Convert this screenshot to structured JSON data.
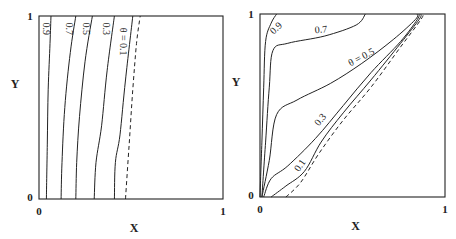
{
  "chart_data": [
    {
      "type": "line",
      "subtype": "contour",
      "panel": "left",
      "title": "",
      "xlabel": "X",
      "ylabel": "Y",
      "xlim": [
        0,
        1
      ],
      "ylim": [
        0,
        1
      ],
      "x_ticks": [
        "0",
        "1"
      ],
      "y_ticks": [
        "0",
        "1"
      ],
      "grid": false,
      "series": [
        {
          "name": "0.9",
          "label": "0.9",
          "style": "solid",
          "points": [
            [
              0.04,
              0
            ],
            [
              0.045,
              0.3
            ],
            [
              0.05,
              0.6
            ],
            [
              0.06,
              0.85
            ],
            [
              0.065,
              1
            ]
          ]
        },
        {
          "name": "0.7",
          "label": "0.7",
          "style": "solid",
          "points": [
            [
              0.12,
              0
            ],
            [
              0.125,
              0.2
            ],
            [
              0.14,
              0.5
            ],
            [
              0.17,
              0.8
            ],
            [
              0.2,
              1
            ]
          ]
        },
        {
          "name": "0.5",
          "label": "0.5",
          "style": "solid",
          "points": [
            [
              0.2,
              0
            ],
            [
              0.205,
              0.2
            ],
            [
              0.22,
              0.45
            ],
            [
              0.25,
              0.75
            ],
            [
              0.29,
              1
            ]
          ]
        },
        {
          "name": "0.3",
          "label": "0.3",
          "style": "solid",
          "points": [
            [
              0.3,
              0
            ],
            [
              0.31,
              0.2
            ],
            [
              0.34,
              0.4
            ],
            [
              0.37,
              0.7
            ],
            [
              0.41,
              1
            ]
          ]
        },
        {
          "name": "0.1",
          "label": "θ = 0.1",
          "style": "solid",
          "points": [
            [
              0.41,
              0
            ],
            [
              0.415,
              0.2
            ],
            [
              0.44,
              0.35
            ],
            [
              0.47,
              0.65
            ],
            [
              0.51,
              1
            ]
          ]
        },
        {
          "name": "boundary",
          "label": "",
          "style": "dashed",
          "points": [
            [
              0.47,
              0
            ],
            [
              0.49,
              0.3
            ],
            [
              0.51,
              0.6
            ],
            [
              0.53,
              0.85
            ],
            [
              0.55,
              1
            ]
          ]
        }
      ]
    },
    {
      "type": "line",
      "subtype": "contour",
      "panel": "right",
      "title": "",
      "xlabel": "X",
      "ylabel": "Y",
      "xlim": [
        0,
        1
      ],
      "ylim": [
        0,
        1
      ],
      "x_ticks": [
        "0",
        "1"
      ],
      "y_ticks": [
        "0",
        "1"
      ],
      "grid": false,
      "series": [
        {
          "name": "0.9",
          "label": "0.9",
          "style": "solid",
          "points": [
            [
              0.0,
              0
            ],
            [
              0.01,
              0.3
            ],
            [
              0.02,
              0.6
            ],
            [
              0.03,
              0.85
            ],
            [
              0.06,
              0.95
            ],
            [
              0.09,
              1
            ]
          ]
        },
        {
          "name": "0.7",
          "label": "0.7",
          "style": "solid",
          "points": [
            [
              0.01,
              0
            ],
            [
              0.03,
              0.3
            ],
            [
              0.05,
              0.6
            ],
            [
              0.07,
              0.8
            ],
            [
              0.15,
              0.84
            ],
            [
              0.35,
              0.88
            ],
            [
              0.52,
              0.94
            ],
            [
              0.57,
              1
            ]
          ]
        },
        {
          "name": "0.5",
          "label": "θ = 0.5",
          "style": "solid",
          "points": [
            [
              0.01,
              0
            ],
            [
              0.05,
              0.2
            ],
            [
              0.09,
              0.45
            ],
            [
              0.2,
              0.53
            ],
            [
              0.38,
              0.62
            ],
            [
              0.55,
              0.73
            ],
            [
              0.72,
              0.86
            ],
            [
              0.84,
              0.97
            ],
            [
              0.85,
              1
            ]
          ]
        },
        {
          "name": "0.3",
          "label": "0.3",
          "style": "solid",
          "points": [
            [
              0.02,
              0
            ],
            [
              0.06,
              0.1
            ],
            [
              0.15,
              0.17
            ],
            [
              0.3,
              0.32
            ],
            [
              0.45,
              0.5
            ],
            [
              0.6,
              0.68
            ],
            [
              0.76,
              0.85
            ],
            [
              0.85,
              0.97
            ],
            [
              0.86,
              1
            ]
          ]
        },
        {
          "name": "0.1",
          "label": "0.1",
          "style": "solid",
          "points": [
            [
              0.06,
              0
            ],
            [
              0.14,
              0.06
            ],
            [
              0.24,
              0.14
            ],
            [
              0.33,
              0.3
            ],
            [
              0.45,
              0.46
            ],
            [
              0.6,
              0.64
            ],
            [
              0.76,
              0.84
            ],
            [
              0.86,
              0.97
            ],
            [
              0.87,
              1
            ]
          ]
        },
        {
          "name": "boundary",
          "label": "",
          "style": "dashed",
          "points": [
            [
              0.14,
              0
            ],
            [
              0.22,
              0.08
            ],
            [
              0.32,
              0.24
            ],
            [
              0.45,
              0.42
            ],
            [
              0.6,
              0.6
            ],
            [
              0.76,
              0.82
            ],
            [
              0.87,
              0.97
            ],
            [
              0.88,
              1
            ]
          ]
        }
      ]
    }
  ]
}
